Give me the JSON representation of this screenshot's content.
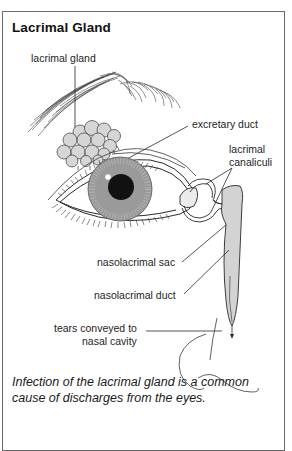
{
  "title": "Lacrimal Gland",
  "labels": {
    "lacrimal_gland": "lacrimal gland",
    "excretary_duct": "excretary duct",
    "canaliculi_line1": "lacrimal",
    "canaliculi_line2": "canaliculi",
    "nasolacrimal_sac": "nasolacrimal sac",
    "nasolacrimal_duct": "nasolacrimal duct",
    "tears_line1": "tears conveyed to",
    "tears_line2": "nasal cavity"
  },
  "caption": "Infection of the lacrimal gland is a common cause of discharges from the eyes.",
  "colors": {
    "iris": "#9a9a9a",
    "pupil": "#111111",
    "gland_fill": "#d6d6d6",
    "sac_fill": "#d3d3d3",
    "line": "#2a2a2a",
    "frame": "#6a6a6a"
  }
}
